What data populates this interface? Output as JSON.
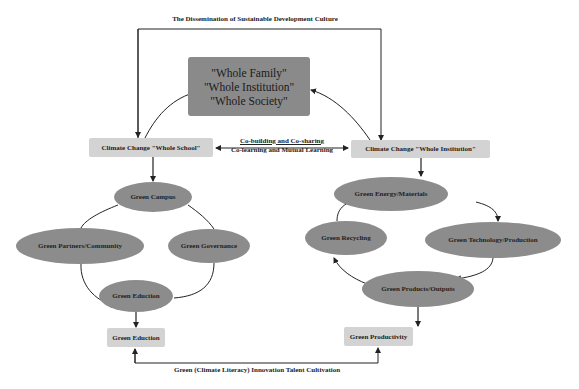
{
  "diagram": {
    "top_caption": "The Dissemination of Sustainable Development Culture",
    "center_box": {
      "lines": [
        "\"Whole Family\"",
        "\"Whole Institution\"",
        "\"Whole Society\""
      ],
      "color": "#8a8a8a"
    },
    "left_header": "Climate Change \"Whole School\"",
    "right_header": "Climate Change \"Whole Institution\"",
    "middle_link": {
      "line1": "Co-building and Co-sharing",
      "line2": "Co-learning and Mutual Learning"
    },
    "left_cycle": {
      "nodes": [
        "Green Campus",
        "Green Partners/Community",
        "Green Governance",
        "Green Eduction"
      ]
    },
    "right_cycle": {
      "nodes": [
        "Green Energy/Materials",
        "Green Recycling",
        "Green Technology/Production",
        "Green Products/Outputs"
      ]
    },
    "left_output": "Green Eduction",
    "right_output": "Green Productivity",
    "bottom_caption": "Green (Climate Literacy) Innovation Talent Cultivation",
    "colors": {
      "ellipse": "#8c8c8c",
      "label_box": "#d3d3d3",
      "center_box": "#8a8a8a",
      "line": "#222222"
    }
  }
}
